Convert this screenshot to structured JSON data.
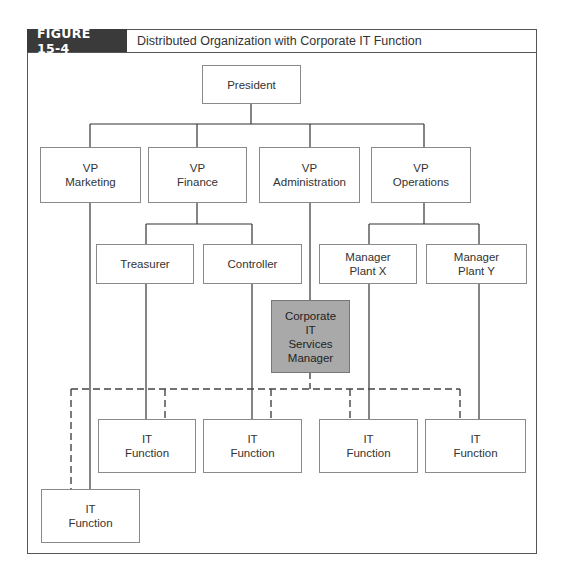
{
  "figure": {
    "label": "FIGURE 15-4",
    "title": "Distributed Organization with Corporate IT Function"
  },
  "nodes": {
    "president": {
      "lines": [
        "President"
      ]
    },
    "vp_marketing": {
      "lines": [
        "VP",
        "Marketing"
      ]
    },
    "vp_finance": {
      "lines": [
        "VP",
        "Finance"
      ]
    },
    "vp_administration": {
      "lines": [
        "VP",
        "Administration"
      ]
    },
    "vp_operations": {
      "lines": [
        "VP",
        "Operations"
      ]
    },
    "treasurer": {
      "lines": [
        "Treasurer"
      ]
    },
    "controller": {
      "lines": [
        "Controller"
      ]
    },
    "manager_plant_x": {
      "lines": [
        "Manager",
        "Plant X"
      ]
    },
    "manager_plant_y": {
      "lines": [
        "Manager",
        "Plant Y"
      ]
    },
    "corporate_it": {
      "lines": [
        "Corporate",
        "IT",
        "Services",
        "Manager"
      ],
      "fill": "#a9a9a9"
    },
    "it_function_treasurer": {
      "lines": [
        "IT",
        "Function"
      ]
    },
    "it_function_controller": {
      "lines": [
        "IT",
        "Function"
      ]
    },
    "it_function_plant_x": {
      "lines": [
        "IT",
        "Function"
      ]
    },
    "it_function_plant_y": {
      "lines": [
        "IT",
        "Function"
      ]
    },
    "it_function_marketing": {
      "lines": [
        "IT",
        "Function"
      ]
    }
  },
  "legend": {
    "solid_line": "direct reporting",
    "dashed_line": "corporate IT coordination"
  }
}
